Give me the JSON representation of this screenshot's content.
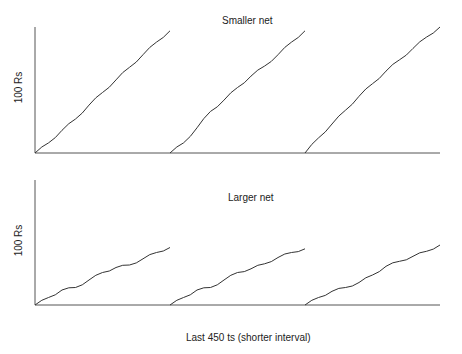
{
  "chart_data": [
    {
      "type": "line",
      "title": "Smaller net",
      "xlabel": "",
      "ylabel": "100 Rs",
      "grid": false,
      "legend": null,
      "note": "Three consecutive runs of cumulative reward, each restarting from zero; axes unlabeled numerically.",
      "series": [
        {
          "name": "run 1",
          "x": [
            0,
            0.1,
            0.2,
            0.3,
            0.4,
            0.5,
            0.6,
            0.7,
            0.8,
            0.9,
            1.0
          ],
          "y": [
            0,
            0.08,
            0.18,
            0.27,
            0.38,
            0.48,
            0.58,
            0.68,
            0.78,
            0.88,
            0.97
          ]
        },
        {
          "name": "run 2",
          "x": [
            0,
            0.1,
            0.2,
            0.3,
            0.4,
            0.5,
            0.6,
            0.7,
            0.8,
            0.9,
            1.0
          ],
          "y": [
            0,
            0.08,
            0.2,
            0.33,
            0.42,
            0.52,
            0.61,
            0.69,
            0.78,
            0.88,
            0.97
          ]
        },
        {
          "name": "run 3",
          "x": [
            0,
            0.1,
            0.2,
            0.3,
            0.4,
            0.5,
            0.6,
            0.7,
            0.8,
            0.9,
            1.0
          ],
          "y": [
            0,
            0.12,
            0.23,
            0.34,
            0.45,
            0.55,
            0.65,
            0.74,
            0.83,
            0.92,
            1.0
          ]
        }
      ]
    },
    {
      "type": "line",
      "title": "Larger net",
      "xlabel": "Last 450 ts (shorter interval)",
      "ylabel": "100 Rs",
      "grid": false,
      "legend": null,
      "series": [
        {
          "name": "run 1",
          "x": [
            0,
            0.1,
            0.2,
            0.3,
            0.4,
            0.5,
            0.6,
            0.7,
            0.8,
            0.9,
            1.0
          ],
          "y": [
            0,
            0.06,
            0.12,
            0.14,
            0.2,
            0.26,
            0.3,
            0.32,
            0.37,
            0.42,
            0.46
          ]
        },
        {
          "name": "run 2",
          "x": [
            0,
            0.1,
            0.2,
            0.3,
            0.4,
            0.5,
            0.6,
            0.7,
            0.8,
            0.9,
            1.0
          ],
          "y": [
            0,
            0.06,
            0.12,
            0.14,
            0.2,
            0.26,
            0.29,
            0.33,
            0.38,
            0.42,
            0.45
          ]
        },
        {
          "name": "run 3",
          "x": [
            0,
            0.1,
            0.2,
            0.3,
            0.4,
            0.5,
            0.6,
            0.7,
            0.8,
            0.9,
            1.0
          ],
          "y": [
            0,
            0.06,
            0.11,
            0.14,
            0.18,
            0.24,
            0.31,
            0.35,
            0.39,
            0.43,
            0.48
          ]
        }
      ]
    }
  ],
  "panels": {
    "top": {
      "title": "Smaller net",
      "ylabel": "100 Rs"
    },
    "bottom": {
      "title": "Larger net",
      "ylabel": "100 Rs",
      "xlabel": "Last 450 ts (shorter interval)"
    }
  },
  "colors": {
    "line": "#333333",
    "axis": "#555555"
  }
}
